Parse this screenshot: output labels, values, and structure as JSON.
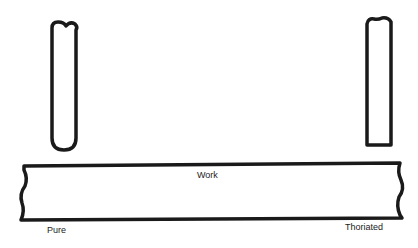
{
  "labels": {
    "work": "Work",
    "pure": "Pure",
    "thoriated": "Thoriated"
  },
  "colors": {
    "stroke": "#1a1a1a",
    "background": "#ffffff"
  }
}
